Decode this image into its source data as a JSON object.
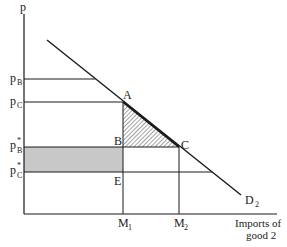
{
  "diagram": {
    "type": "tariff-welfare-diagram",
    "axes": {
      "y_label": "p",
      "x_label_line1": "Imports of",
      "x_label_line2": "good 2"
    },
    "curve": {
      "name": "D",
      "subscript": "2"
    },
    "price_levels": [
      {
        "id": "pB",
        "base": "p",
        "sup": "",
        "sub": "B"
      },
      {
        "id": "pC",
        "base": "p",
        "sup": "",
        "sub": "C"
      },
      {
        "id": "pBstar",
        "base": "p",
        "sup": "*",
        "sub": "B"
      },
      {
        "id": "pCstar",
        "base": "p",
        "sup": "*",
        "sub": "C"
      }
    ],
    "quantities": [
      {
        "id": "M1",
        "base": "M",
        "sub": "1"
      },
      {
        "id": "M2",
        "base": "M",
        "sub": "2"
      }
    ],
    "points": [
      "A",
      "B",
      "C",
      "E"
    ],
    "regions": {
      "hatched_triangle": "ABC",
      "shaded_rectangle": "pB*-B-E-pC*"
    },
    "colors": {
      "line": "#1a1a1a",
      "shade": "#c8c8c8",
      "hatch": "#333333"
    }
  }
}
